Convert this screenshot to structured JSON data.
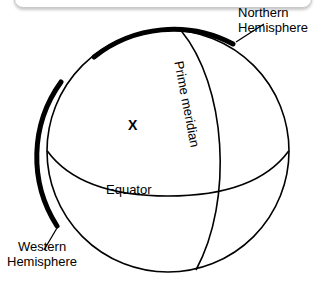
{
  "diagram": {
    "title_visible": false,
    "background_color": "#ffffff",
    "line_color": "#000000",
    "panel_border_color": "#c9c9c9"
  },
  "labels": {
    "northern_line1": "Northern",
    "northern_line2": "Hemisphere",
    "western_line1": "Western",
    "western_line2": "Hemisphere",
    "equator": "Equator",
    "prime_meridian": "Prime meridian",
    "point_marker": "X"
  },
  "geometry": {
    "sphere_center_x": 168,
    "sphere_center_y": 151,
    "sphere_radius": 121,
    "northern_arc_thickness": 5,
    "western_arc_thickness": 5,
    "outline_thickness": 1.4
  }
}
